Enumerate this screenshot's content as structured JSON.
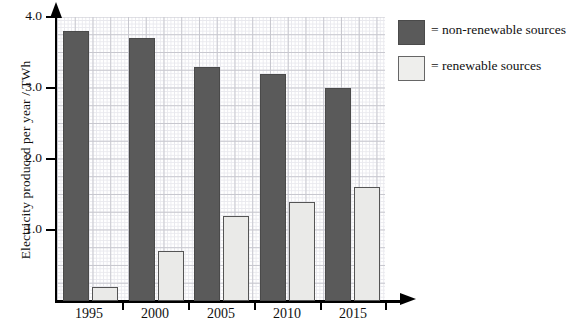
{
  "chart_data": {
    "type": "bar",
    "title": "",
    "xlabel": "",
    "ylabel": "Electricity produced per year / TWh",
    "categories": [
      "1995",
      "2000",
      "2005",
      "2010",
      "2015"
    ],
    "series": [
      {
        "name": "non-renewable sources",
        "color": "#5a5a5a",
        "values": [
          3.8,
          3.7,
          3.3,
          3.2,
          3.0
        ]
      },
      {
        "name": "renewable sources",
        "color": "#eaeae8",
        "values": [
          0.2,
          0.7,
          1.2,
          1.4,
          1.6
        ]
      }
    ],
    "ylim": [
      0,
      4.0
    ],
    "yticks": [
      "1.0",
      "2.0",
      "3.0",
      "4.0"
    ],
    "ytick_values": [
      1.0,
      2.0,
      3.0,
      4.0
    ],
    "grid": true,
    "grid_minor": true,
    "legend_position": "right"
  },
  "axes": {
    "y_label": "Electricity produced per year / TWh",
    "y_ticks": [
      {
        "label": "4.0",
        "value": 4.0
      },
      {
        "label": "3.0",
        "value": 3.0
      },
      {
        "label": "2.0",
        "value": 2.0
      },
      {
        "label": "1.0",
        "value": 1.0
      }
    ],
    "x_ticks": [
      {
        "label": "1995"
      },
      {
        "label": "2000"
      },
      {
        "label": "2005"
      },
      {
        "label": "2010"
      },
      {
        "label": "2015"
      }
    ]
  },
  "legend": {
    "items": [
      {
        "swatch": "non-renewable-swatch",
        "label": "= non-renewable sources",
        "color": "#5a5a5a"
      },
      {
        "swatch": "renewable-swatch",
        "label": "= renewable sources",
        "color": "#eeeeec"
      }
    ]
  }
}
